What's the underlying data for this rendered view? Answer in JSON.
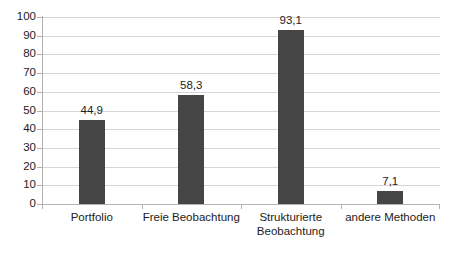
{
  "chart_data": {
    "type": "bar",
    "title": "",
    "subtitle": "",
    "xlabel": "",
    "ylabel": "",
    "categories": [
      "Portfolio",
      "Freie Beobachtung",
      "Strukturierte Beobachtung",
      "andere Methoden"
    ],
    "category_lines": [
      [
        "Portfolio"
      ],
      [
        "Freie Beobachtung"
      ],
      [
        "Strukturierte",
        "Beobachtung"
      ],
      [
        "andere Methoden"
      ]
    ],
    "values": [
      44.9,
      58.3,
      93.1,
      7.1
    ],
    "value_labels": [
      "44,9",
      "58,3",
      "93,1",
      "7,1"
    ],
    "ylim": [
      0,
      100
    ],
    "ytick_step": 10,
    "ytick_labels": [
      "100",
      "90",
      "80",
      "70",
      "60",
      "50",
      "40",
      "30",
      "20",
      "10",
      "0"
    ],
    "ytick_values": [
      100,
      90,
      80,
      70,
      60,
      50,
      40,
      30,
      20,
      10,
      0
    ],
    "grid": true,
    "grid_axis": "y",
    "legend": false,
    "legend_position": "none",
    "decimal_separator": ",",
    "colors": {
      "bar": "#454545",
      "gridline": "#d6d6d6",
      "axis": "#b0b0b0",
      "text": "#1c1c1c",
      "background": "#ffffff"
    }
  }
}
